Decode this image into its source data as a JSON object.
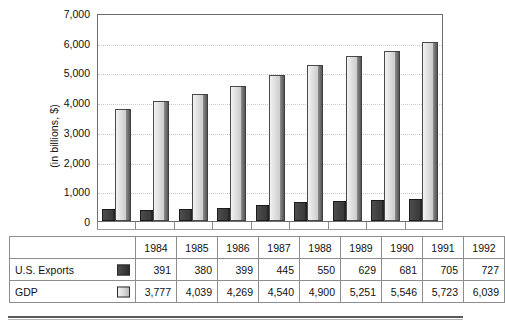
{
  "chart_data": {
    "type": "bar",
    "title": "",
    "subtitle": "",
    "xlabel": "",
    "ylabel": "(in billions, $)",
    "categories": [
      "1984",
      "1985",
      "1986",
      "1987",
      "1988",
      "1989",
      "1990",
      "1991",
      "1992"
    ],
    "series": [
      {
        "name": "U.S. Exports",
        "values": [
          391,
          380,
          399,
          445,
          550,
          629,
          681,
          705,
          727
        ],
        "color": "#3a3a3a"
      },
      {
        "name": "GDP",
        "values": [
          3777,
          4039,
          4269,
          4540,
          4900,
          5251,
          5546,
          5723,
          6039
        ],
        "color": "#d8d8d8"
      }
    ],
    "ylim": [
      0,
      7000
    ],
    "ytick_labels": [
      "7,000",
      "6,000",
      "5,000",
      "4,000",
      "3,000",
      "2,000",
      "1,000",
      "0"
    ],
    "ytick_values": [
      7000,
      6000,
      5000,
      4000,
      3000,
      2000,
      1000,
      0
    ],
    "grid": true,
    "grid_style": "dotted-horizontal",
    "legend": "in-table-row-labels"
  },
  "table": {
    "corner_label": "",
    "header": [
      "1984",
      "1985",
      "1986",
      "1987",
      "1988",
      "1989",
      "1990",
      "1991",
      "1992"
    ],
    "rows": [
      {
        "label": "U.S. Exports",
        "swatch": "exports-swatch",
        "values": [
          "391",
          "380",
          "399",
          "445",
          "550",
          "629",
          "681",
          "705",
          "727"
        ]
      },
      {
        "label": "GDP",
        "swatch": "gdp-swatch",
        "values": [
          "3,777",
          "4,039",
          "4,269",
          "4,540",
          "4,900",
          "5,251",
          "5,546",
          "5,723",
          "6,039"
        ]
      }
    ]
  }
}
